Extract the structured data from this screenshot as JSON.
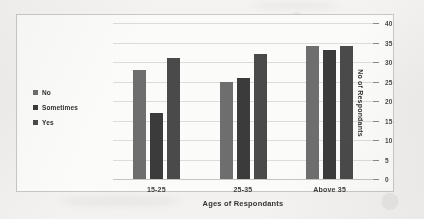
{
  "chart_data": {
    "type": "bar",
    "title": "",
    "xlabel": "Ages of Respondants",
    "ylabel": "No of Respondants",
    "categories": [
      "15-25",
      "25-35",
      "Above 35"
    ],
    "series": [
      {
        "name": "No",
        "values": [
          28,
          25,
          34
        ],
        "color": "#6e6e6e"
      },
      {
        "name": "Sometimes",
        "values": [
          17,
          26,
          33
        ],
        "color": "#3b3b3b"
      },
      {
        "name": "Yes",
        "values": [
          31,
          32,
          34
        ],
        "color": "#4a4a4a"
      }
    ],
    "ylim": [
      0,
      40
    ],
    "yticks": [
      0,
      5,
      10,
      15,
      20,
      25,
      30,
      35,
      40
    ],
    "ytick_labels": [
      "0",
      "5",
      "10",
      "15",
      "20",
      "25",
      "30",
      "35",
      "40"
    ],
    "grid": true,
    "y_axis_position": "right",
    "legend_position": "left",
    "orientation": "vertical",
    "grouped": true
  },
  "legend": {
    "items": [
      {
        "label": "No",
        "color": "#6e6e6e"
      },
      {
        "label": "Sometimes",
        "color": "#3b3b3b"
      },
      {
        "label": "Yes",
        "color": "#4a4a4a"
      }
    ]
  },
  "axes": {
    "x_title": "Ages of Respondants",
    "y_title": "No of Respondants"
  }
}
